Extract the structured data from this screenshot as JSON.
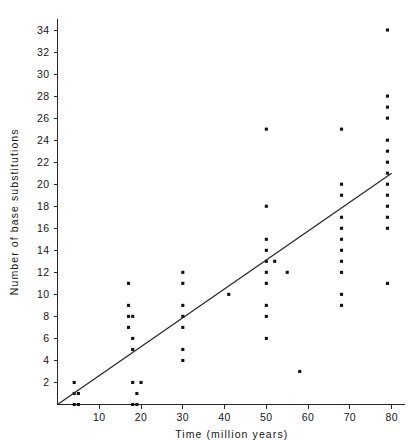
{
  "chart_data": {
    "type": "scatter",
    "title": "",
    "xlabel": "Time (million years)",
    "ylabel": "Number of base substitutions",
    "xlim": [
      0,
      82
    ],
    "ylim": [
      0,
      35
    ],
    "xticks": [
      10,
      20,
      30,
      40,
      50,
      60,
      70,
      80
    ],
    "yticks": [
      2,
      4,
      6,
      8,
      10,
      12,
      14,
      16,
      18,
      20,
      22,
      24,
      26,
      28,
      30,
      32,
      34
    ],
    "grid": false,
    "legend": null,
    "point_color": "#111111",
    "line_color": "#2b2b2b",
    "points": [
      {
        "x": 4,
        "y": 0
      },
      {
        "x": 5,
        "y": 0
      },
      {
        "x": 4,
        "y": 1
      },
      {
        "x": 5,
        "y": 1
      },
      {
        "x": 4,
        "y": 2
      },
      {
        "x": 18,
        "y": 0
      },
      {
        "x": 19,
        "y": 0
      },
      {
        "x": 18,
        "y": 2
      },
      {
        "x": 20,
        "y": 2
      },
      {
        "x": 19,
        "y": 1
      },
      {
        "x": 18,
        "y": 5
      },
      {
        "x": 18,
        "y": 6
      },
      {
        "x": 17,
        "y": 7
      },
      {
        "x": 17,
        "y": 8
      },
      {
        "x": 18,
        "y": 8
      },
      {
        "x": 17,
        "y": 9
      },
      {
        "x": 17,
        "y": 11
      },
      {
        "x": 30,
        "y": 4
      },
      {
        "x": 30,
        "y": 5
      },
      {
        "x": 30,
        "y": 7
      },
      {
        "x": 30,
        "y": 8
      },
      {
        "x": 30,
        "y": 9
      },
      {
        "x": 30,
        "y": 11
      },
      {
        "x": 30,
        "y": 12
      },
      {
        "x": 41,
        "y": 10
      },
      {
        "x": 50,
        "y": 6
      },
      {
        "x": 50,
        "y": 8
      },
      {
        "x": 50,
        "y": 9
      },
      {
        "x": 50,
        "y": 11
      },
      {
        "x": 50,
        "y": 12
      },
      {
        "x": 50,
        "y": 13
      },
      {
        "x": 52,
        "y": 13
      },
      {
        "x": 50,
        "y": 14
      },
      {
        "x": 50,
        "y": 15
      },
      {
        "x": 50,
        "y": 18
      },
      {
        "x": 50,
        "y": 25
      },
      {
        "x": 55,
        "y": 12
      },
      {
        "x": 58,
        "y": 3
      },
      {
        "x": 68,
        "y": 9
      },
      {
        "x": 68,
        "y": 10
      },
      {
        "x": 68,
        "y": 12
      },
      {
        "x": 68,
        "y": 13
      },
      {
        "x": 68,
        "y": 14
      },
      {
        "x": 68,
        "y": 15
      },
      {
        "x": 68,
        "y": 16
      },
      {
        "x": 68,
        "y": 17
      },
      {
        "x": 68,
        "y": 19
      },
      {
        "x": 68,
        "y": 20
      },
      {
        "x": 68,
        "y": 25
      },
      {
        "x": 79,
        "y": 11
      },
      {
        "x": 79,
        "y": 16
      },
      {
        "x": 79,
        "y": 17
      },
      {
        "x": 79,
        "y": 18
      },
      {
        "x": 79,
        "y": 19
      },
      {
        "x": 79,
        "y": 20
      },
      {
        "x": 79,
        "y": 21
      },
      {
        "x": 79,
        "y": 22
      },
      {
        "x": 79,
        "y": 23
      },
      {
        "x": 79,
        "y": 24
      },
      {
        "x": 79,
        "y": 26
      },
      {
        "x": 79,
        "y": 27
      },
      {
        "x": 79,
        "y": 28
      },
      {
        "x": 79,
        "y": 34
      }
    ],
    "trend_line": {
      "x_start": 0,
      "y_start": 0,
      "x_end": 80,
      "y_end": 21
    }
  }
}
